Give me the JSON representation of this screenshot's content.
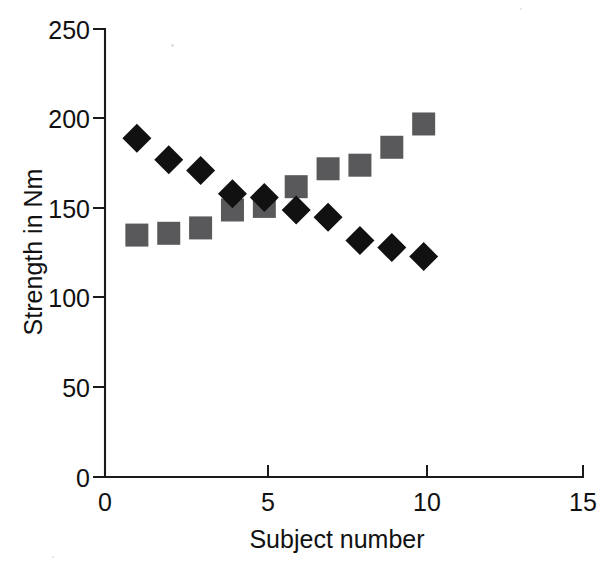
{
  "chart_data": {
    "type": "scatter",
    "title": "",
    "subtitle": "",
    "xlabel": "Subject number",
    "ylabel": "Strength in Nm",
    "x": [
      1,
      2,
      3,
      4,
      5,
      6,
      7,
      8,
      9,
      10
    ],
    "series": [
      {
        "name": "diamond-series",
        "marker": "diamond",
        "color": "#111111",
        "values": [
          189,
          177,
          171,
          158,
          156,
          149,
          145,
          132,
          128,
          123
        ]
      },
      {
        "name": "square-series",
        "marker": "square",
        "color": "#59595b",
        "values": [
          135,
          136,
          139,
          149,
          151,
          162,
          172,
          174,
          184,
          197
        ]
      }
    ],
    "xlim": [
      0,
      15
    ],
    "ylim": [
      0,
      250
    ],
    "xticks": [
      0,
      5,
      10,
      15
    ],
    "xtick_labels": [
      "0",
      "5",
      "10",
      "15"
    ],
    "yticks": [
      0,
      50,
      100,
      150,
      200,
      250
    ],
    "ytick_labels": [
      "0",
      "50",
      "100",
      "150",
      "200",
      "250"
    ],
    "grid": false,
    "legend": "none"
  },
  "axes": {
    "y_title": "Strength in Nm",
    "x_title": "Subject number",
    "y_tick_0": "0",
    "y_tick_1": "50",
    "y_tick_2": "100",
    "y_tick_3": "150",
    "y_tick_4": "200",
    "y_tick_5": "250",
    "x_tick_0": "0",
    "x_tick_1": "5",
    "x_tick_2": "10",
    "x_tick_3": "15"
  },
  "style": {
    "background": "#ffffff",
    "axis_color": "#1a1a1a",
    "diamond_color": "#111111",
    "square_color": "#59595b"
  }
}
